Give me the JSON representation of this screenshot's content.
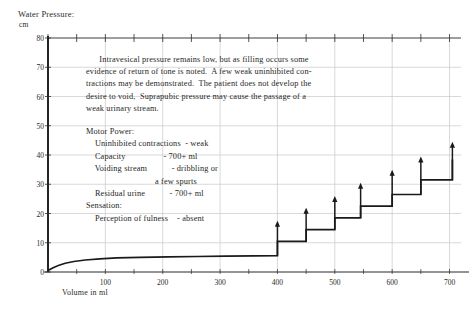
{
  "axes": {
    "y_title": "Water Pressure:",
    "y_unit": "cm",
    "x_title": "Volume in ml"
  },
  "paragraph": "      Intravesical pressure remains low, but as filling occurs some\nevidence of return of tone is noted.  A few weak uninhibited con-\ntractions may be demonstrated.  The patient does not develop the\ndesire to void,  Suprapubic pressure may cause the passage of a\nweak urinary stream.",
  "findings": "Motor Power:\n    Uninhibited contractions  - weak\n    Capacity                 - 700+ ml\n    Voiding stream           - dribbling or\n                               a few spurts\n    Residual urine           - 700+ ml\nSensation:\n    Perception of fulness    - absent",
  "colors": {
    "ink": "#1a1a1a",
    "grid": "#c9c9c9",
    "axis": "#2b2b2b"
  },
  "chart_data": {
    "type": "line",
    "title": "Water Pressure:",
    "xlabel": "Volume in ml",
    "ylabel": "cm",
    "xlim": [
      0,
      720
    ],
    "ylim": [
      0,
      80
    ],
    "xticks": [
      100,
      200,
      300,
      400,
      500,
      600,
      700
    ],
    "yticks": [
      0,
      10,
      20,
      30,
      40,
      50,
      60,
      70,
      80
    ],
    "grid": true,
    "legend": "none",
    "series": [
      {
        "name": "Intravesical pressure (cystometrogram)",
        "comment": "Low flat filling curve then stepped uninhibited contractions after 400 ml",
        "points": [
          [
            0,
            0.5
          ],
          [
            8,
            1.4
          ],
          [
            18,
            2.2
          ],
          [
            30,
            3.0
          ],
          [
            45,
            3.6
          ],
          [
            65,
            4.1
          ],
          [
            90,
            4.5
          ],
          [
            120,
            4.8
          ],
          [
            160,
            5.0
          ],
          [
            210,
            5.2
          ],
          [
            260,
            5.3
          ],
          [
            310,
            5.4
          ],
          [
            360,
            5.5
          ],
          [
            400,
            5.6
          ],
          [
            400,
            10.5
          ],
          [
            450,
            10.5
          ],
          [
            450,
            14.5
          ],
          [
            500,
            14.5
          ],
          [
            500,
            18.5
          ],
          [
            545,
            18.5
          ],
          [
            545,
            22.5
          ],
          [
            600,
            22.5
          ],
          [
            600,
            26.5
          ],
          [
            650,
            26.5
          ],
          [
            650,
            31.5
          ],
          [
            705,
            31.5
          ],
          [
            705,
            38.5
          ]
        ]
      }
    ],
    "contraction_arrows": [
      {
        "x": 400,
        "base": 5.6,
        "tip": 17.5
      },
      {
        "x": 450,
        "base": 10.5,
        "tip": 22.0
      },
      {
        "x": 500,
        "base": 14.5,
        "tip": 26.0
      },
      {
        "x": 545,
        "base": 18.5,
        "tip": 30.5
      },
      {
        "x": 600,
        "base": 22.5,
        "tip": 35.0
      },
      {
        "x": 650,
        "base": 26.5,
        "tip": 39.5
      },
      {
        "x": 705,
        "base": 31.5,
        "tip": 44.5
      }
    ]
  }
}
